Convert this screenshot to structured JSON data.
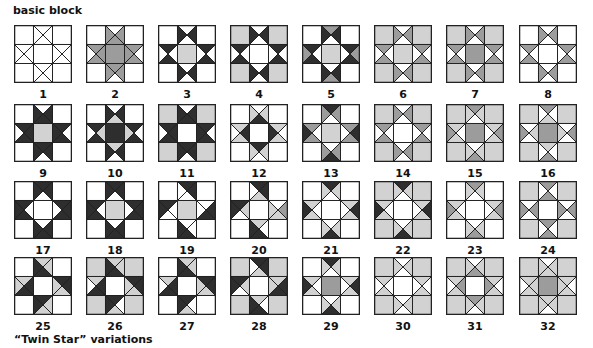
{
  "titles": {
    "top": "basic block",
    "bottom": "“Twin Star” variations"
  },
  "colors": {
    "W": "#ffffff",
    "L": "#d2d2d2",
    "M": "#9c9c9c",
    "D": "#2e2e2e",
    "line": "#222222"
  },
  "layout": {
    "columns_x": [
      14,
      86,
      158,
      230,
      302,
      374,
      446,
      519
    ],
    "rows_y": [
      25,
      104,
      181,
      257
    ],
    "label_offset": 63
  },
  "blocks": [
    {
      "n": "1",
      "corner": "W",
      "center": "W",
      "top": [
        "W",
        "W",
        "W",
        "W"
      ],
      "right": [
        "W",
        "W",
        "W",
        "W"
      ],
      "bottom": [
        "W",
        "W",
        "W",
        "W"
      ],
      "left": [
        "W",
        "W",
        "W",
        "W"
      ]
    },
    {
      "n": "2",
      "corner": "W",
      "center": "M",
      "top": [
        "W",
        "M",
        "M",
        "M"
      ],
      "right": [
        "M",
        "W",
        "M",
        "M"
      ],
      "bottom": [
        "M",
        "M",
        "W",
        "M"
      ],
      "left": [
        "M",
        "M",
        "M",
        "W"
      ]
    },
    {
      "n": "3",
      "corner": "W",
      "center": "L",
      "top": [
        "W",
        "D",
        "W",
        "D"
      ],
      "right": [
        "D",
        "W",
        "D",
        "W"
      ],
      "bottom": [
        "W",
        "D",
        "W",
        "D"
      ],
      "left": [
        "D",
        "W",
        "D",
        "W"
      ]
    },
    {
      "n": "4",
      "corner": "L",
      "center": "W",
      "top": [
        "W",
        "D",
        "W",
        "D"
      ],
      "right": [
        "D",
        "W",
        "D",
        "W"
      ],
      "bottom": [
        "W",
        "D",
        "W",
        "D"
      ],
      "left": [
        "D",
        "W",
        "D",
        "W"
      ]
    },
    {
      "n": "5",
      "corner": "W",
      "center": "L",
      "top": [
        "M",
        "D",
        "W",
        "D"
      ],
      "right": [
        "D",
        "M",
        "D",
        "W"
      ],
      "bottom": [
        "W",
        "D",
        "M",
        "D"
      ],
      "left": [
        "D",
        "W",
        "D",
        "M"
      ]
    },
    {
      "n": "6",
      "corner": "L",
      "center": "L",
      "top": [
        "W",
        "M",
        "W",
        "M"
      ],
      "right": [
        "M",
        "W",
        "M",
        "W"
      ],
      "bottom": [
        "W",
        "M",
        "W",
        "M"
      ],
      "left": [
        "M",
        "W",
        "M",
        "W"
      ]
    },
    {
      "n": "7",
      "corner": "L",
      "center": "M",
      "top": [
        "W",
        "M",
        "W",
        "M"
      ],
      "right": [
        "M",
        "W",
        "M",
        "W"
      ],
      "bottom": [
        "W",
        "M",
        "W",
        "M"
      ],
      "left": [
        "M",
        "W",
        "M",
        "W"
      ]
    },
    {
      "n": "8",
      "corner": "W",
      "center": "W",
      "top": [
        "W",
        "M",
        "W",
        "M"
      ],
      "right": [
        "M",
        "W",
        "M",
        "W"
      ],
      "bottom": [
        "W",
        "M",
        "W",
        "M"
      ],
      "left": [
        "M",
        "W",
        "M",
        "W"
      ]
    },
    {
      "n": "9",
      "corner": "W",
      "center": "L",
      "top": [
        "W",
        "D",
        "D",
        "D"
      ],
      "right": [
        "D",
        "W",
        "D",
        "D"
      ],
      "bottom": [
        "D",
        "D",
        "W",
        "D"
      ],
      "left": [
        "D",
        "D",
        "D",
        "W"
      ]
    },
    {
      "n": "10",
      "corner": "W",
      "center": "D",
      "top": [
        "W",
        "D",
        "L",
        "D"
      ],
      "right": [
        "D",
        "W",
        "D",
        "L"
      ],
      "bottom": [
        "L",
        "D",
        "W",
        "D"
      ],
      "left": [
        "D",
        "L",
        "D",
        "W"
      ]
    },
    {
      "n": "11",
      "corner": "L",
      "center": "W",
      "top": [
        "W",
        "D",
        "D",
        "D"
      ],
      "right": [
        "D",
        "W",
        "D",
        "D"
      ],
      "bottom": [
        "D",
        "D",
        "W",
        "D"
      ],
      "left": [
        "D",
        "D",
        "D",
        "W"
      ]
    },
    {
      "n": "12",
      "corner": "W",
      "center": "W",
      "top": [
        "W",
        "L",
        "D",
        "L"
      ],
      "right": [
        "L",
        "W",
        "L",
        "D"
      ],
      "bottom": [
        "D",
        "L",
        "W",
        "L"
      ],
      "left": [
        "L",
        "D",
        "L",
        "W"
      ]
    },
    {
      "n": "13",
      "corner": "W",
      "center": "L",
      "top": [
        "D",
        "M",
        "W",
        "M"
      ],
      "right": [
        "M",
        "D",
        "M",
        "W"
      ],
      "bottom": [
        "W",
        "M",
        "D",
        "M"
      ],
      "left": [
        "M",
        "W",
        "M",
        "D"
      ]
    },
    {
      "n": "14",
      "corner": "L",
      "center": "W",
      "top": [
        "W",
        "M",
        "W",
        "M"
      ],
      "right": [
        "M",
        "W",
        "M",
        "W"
      ],
      "bottom": [
        "W",
        "M",
        "W",
        "M"
      ],
      "left": [
        "M",
        "W",
        "M",
        "W"
      ]
    },
    {
      "n": "15",
      "corner": "L",
      "center": "M",
      "top": [
        "M",
        "L",
        "W",
        "L"
      ],
      "right": [
        "L",
        "M",
        "L",
        "W"
      ],
      "bottom": [
        "W",
        "L",
        "M",
        "L"
      ],
      "left": [
        "L",
        "W",
        "L",
        "M"
      ]
    },
    {
      "n": "16",
      "corner": "L",
      "center": "M",
      "top": [
        "M",
        "W",
        "L",
        "W"
      ],
      "right": [
        "W",
        "M",
        "W",
        "L"
      ],
      "bottom": [
        "L",
        "W",
        "M",
        "W"
      ],
      "left": [
        "W",
        "L",
        "W",
        "M"
      ]
    },
    {
      "n": "17",
      "corner": "W",
      "center": "W",
      "top": [
        "D",
        "D",
        "W",
        "D"
      ],
      "right": [
        "D",
        "D",
        "D",
        "W"
      ],
      "bottom": [
        "W",
        "D",
        "D",
        "D"
      ],
      "left": [
        "D",
        "W",
        "D",
        "D"
      ]
    },
    {
      "n": "18",
      "corner": "W",
      "center": "L",
      "top": [
        "D",
        "D",
        "W",
        "D"
      ],
      "right": [
        "D",
        "D",
        "D",
        "W"
      ],
      "bottom": [
        "W",
        "D",
        "D",
        "D"
      ],
      "left": [
        "D",
        "W",
        "D",
        "D"
      ]
    },
    {
      "n": "19",
      "corner": "W",
      "center": "L",
      "top": [
        "D",
        "D",
        "W",
        "W"
      ],
      "right": [
        "W",
        "D",
        "D",
        "W"
      ],
      "bottom": [
        "W",
        "W",
        "D",
        "D"
      ],
      "left": [
        "D",
        "W",
        "W",
        "D"
      ]
    },
    {
      "n": "20",
      "corner": "W",
      "center": "W",
      "top": [
        "D",
        "D",
        "L",
        "W"
      ],
      "right": [
        "W",
        "M",
        "L",
        "L"
      ],
      "bottom": [
        "L",
        "W",
        "D",
        "D"
      ],
      "left": [
        "D",
        "L",
        "W",
        "D"
      ]
    },
    {
      "n": "21",
      "corner": "W",
      "center": "W",
      "top": [
        "D",
        "L",
        "W",
        "L"
      ],
      "right": [
        "L",
        "D",
        "L",
        "W"
      ],
      "bottom": [
        "W",
        "L",
        "D",
        "L"
      ],
      "left": [
        "L",
        "W",
        "L",
        "D"
      ]
    },
    {
      "n": "22",
      "corner": "L",
      "center": "W",
      "top": [
        "D",
        "L",
        "W",
        "L"
      ],
      "right": [
        "L",
        "D",
        "L",
        "W"
      ],
      "bottom": [
        "W",
        "L",
        "D",
        "L"
      ],
      "left": [
        "L",
        "W",
        "L",
        "D"
      ]
    },
    {
      "n": "23",
      "corner": "W",
      "center": "W",
      "top": [
        "M",
        "L",
        "W",
        "L"
      ],
      "right": [
        "L",
        "M",
        "L",
        "W"
      ],
      "bottom": [
        "W",
        "L",
        "M",
        "L"
      ],
      "left": [
        "L",
        "W",
        "L",
        "M"
      ]
    },
    {
      "n": "24",
      "corner": "L",
      "center": "W",
      "top": [
        "M",
        "W",
        "M",
        "W"
      ],
      "right": [
        "W",
        "M",
        "W",
        "M"
      ],
      "bottom": [
        "M",
        "W",
        "M",
        "W"
      ],
      "left": [
        "W",
        "M",
        "W",
        "M"
      ]
    },
    {
      "n": "25",
      "corner": "W",
      "center": "W",
      "top": [
        "L",
        "L",
        "D",
        "D"
      ],
      "right": [
        "D",
        "D",
        "L",
        "L"
      ],
      "bottom": [
        "D",
        "L",
        "L",
        "D"
      ],
      "left": [
        "L",
        "D",
        "D",
        "L"
      ]
    },
    {
      "n": "26",
      "corner": "L",
      "center": "W",
      "top": [
        "L",
        "L",
        "D",
        "D"
      ],
      "right": [
        "D",
        "D",
        "L",
        "L"
      ],
      "bottom": [
        "D",
        "W",
        "L",
        "D"
      ],
      "left": [
        "L",
        "D",
        "D",
        "W"
      ]
    },
    {
      "n": "27",
      "corner": "W",
      "center": "W",
      "top": [
        "L",
        "L",
        "D",
        "D"
      ],
      "right": [
        "D",
        "D",
        "L",
        "L"
      ],
      "bottom": [
        "D",
        "W",
        "L",
        "D"
      ],
      "left": [
        "L",
        "D",
        "D",
        "W"
      ]
    },
    {
      "n": "28",
      "corner": "L",
      "center": "W",
      "top": [
        "D",
        "D",
        "L",
        "W"
      ],
      "right": [
        "L",
        "D",
        "D",
        "L"
      ],
      "bottom": [
        "L",
        "W",
        "D",
        "D"
      ],
      "left": [
        "D",
        "L",
        "W",
        "D"
      ]
    },
    {
      "n": "29",
      "corner": "W",
      "center": "M",
      "top": [
        "D",
        "L",
        "W",
        "L"
      ],
      "right": [
        "L",
        "D",
        "L",
        "W"
      ],
      "bottom": [
        "W",
        "L",
        "D",
        "L"
      ],
      "left": [
        "L",
        "W",
        "L",
        "D"
      ]
    },
    {
      "n": "30",
      "corner": "L",
      "center": "W",
      "top": [
        "W",
        "L",
        "W",
        "L"
      ],
      "right": [
        "L",
        "W",
        "L",
        "W"
      ],
      "bottom": [
        "W",
        "L",
        "W",
        "L"
      ],
      "left": [
        "L",
        "W",
        "L",
        "W"
      ]
    },
    {
      "n": "31",
      "corner": "L",
      "center": "W",
      "top": [
        "W",
        "L",
        "M",
        "L"
      ],
      "right": [
        "L",
        "W",
        "L",
        "M"
      ],
      "bottom": [
        "M",
        "L",
        "W",
        "L"
      ],
      "left": [
        "L",
        "M",
        "L",
        "W"
      ]
    },
    {
      "n": "32",
      "corner": "L",
      "center": "M",
      "top": [
        "W",
        "L",
        "L",
        "L"
      ],
      "right": [
        "L",
        "W",
        "L",
        "L"
      ],
      "bottom": [
        "L",
        "L",
        "W",
        "L"
      ],
      "left": [
        "L",
        "L",
        "L",
        "W"
      ]
    }
  ]
}
